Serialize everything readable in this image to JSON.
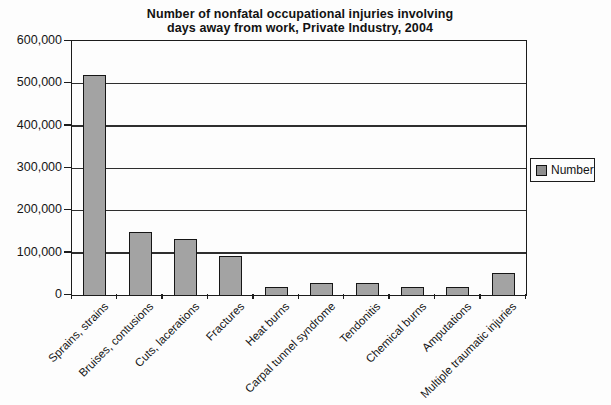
{
  "chart_data": {
    "type": "bar",
    "title_lines": [
      "Number of nonfatal occupational injuries involving",
      "days away from work, Private Industry, 2004"
    ],
    "categories": [
      "Sprains, strains",
      "Bruises, contusions",
      "Cuts, lacerations",
      "Fractures",
      "Heat burns",
      "Carpal tunnel syndrome",
      "Tendonitis",
      "Chemical burns",
      "Amputations",
      "Multiple traumatic injuries"
    ],
    "values": [
      520000,
      150000,
      133000,
      91000,
      20000,
      29000,
      28000,
      18000,
      18000,
      52000
    ],
    "series": [
      {
        "name": "Number"
      }
    ],
    "legend": {
      "label": "Number",
      "position": "right"
    },
    "xlabel": "",
    "ylabel": "",
    "ylim": [
      0,
      600000
    ],
    "ytick_step": 100000,
    "ytick_labels": [
      "0",
      "100,000",
      "200,000",
      "300,000",
      "400,000",
      "500,000",
      "600,000"
    ],
    "grid": true,
    "bar_color": "#a3a3a3",
    "bar_border_color": "#161616",
    "axis_color": "#1c1c1c"
  }
}
